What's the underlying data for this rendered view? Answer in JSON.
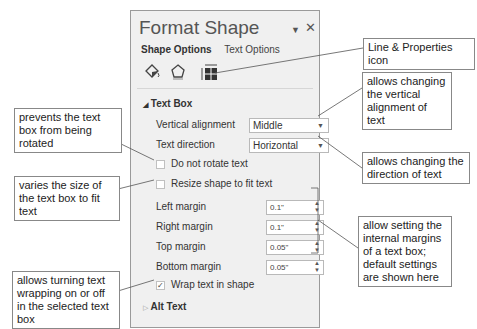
{
  "panel": {
    "title": "Format Shape",
    "tabs": [
      "Shape Options",
      "Text Options"
    ],
    "icons": [
      "fill-line-icon",
      "effects-icon",
      "size-properties-icon"
    ],
    "section_text_box": "Text Box",
    "vertical_alignment_label": "Vertical alignment",
    "vertical_alignment_value": "Middle",
    "text_direction_label": "Text direction",
    "text_direction_value": "Horizontal",
    "do_not_rotate_label": "Do not rotate text",
    "resize_label": "Resize shape to fit text",
    "margins": [
      {
        "label": "Left margin",
        "value": "0.1\""
      },
      {
        "label": "Right margin",
        "value": "0.1\""
      },
      {
        "label": "Top margin",
        "value": "0.05\""
      },
      {
        "label": "Bottom margin",
        "value": "0.05\""
      }
    ],
    "wrap_label": "Wrap text in shape",
    "wrap_checked": true,
    "section_alt_text": "Alt Text"
  },
  "callouts": {
    "line_properties": "Line & Properties icon",
    "vertical_alignment": "allows changing the vertical alignment of text",
    "direction": "allows changing the direction of text",
    "margins": "allow setting the internal margins of a text box; default settings are shown here",
    "rotate": "prevents the text box from being rotated",
    "resize": "varies the size of the text box to fit text",
    "wrap": "allows turning text wrapping on or off in the selected text box"
  }
}
